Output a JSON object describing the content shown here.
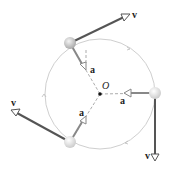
{
  "diagram": {
    "center_label": "O",
    "velocity_label": "v",
    "acceleration_label": "a",
    "colors": {
      "circle": "#c8c8c8",
      "velocity": "#555555",
      "accel": "#8a8a8a",
      "ball": "#cfcfcf"
    }
  }
}
